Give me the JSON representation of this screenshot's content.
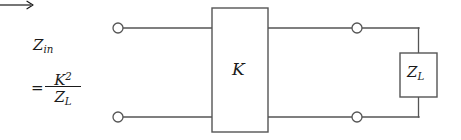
{
  "figure": {
    "type": "circuit-diagram",
    "background_color": "#ffffff",
    "line_color": "#555555",
    "text_color": "#1a1a1a"
  },
  "labels": {
    "input_impedance": {
      "symbol": "Z",
      "subscript": "in",
      "arrow": "⟶"
    },
    "equation": {
      "equals": "=",
      "numerator_base": "K",
      "numerator_exponent": "2",
      "denominator_base": "Z",
      "denominator_subscript": "L"
    },
    "inverter_box": {
      "symbol": "K"
    },
    "load_box": {
      "symbol": "Z",
      "subscript": "L"
    }
  },
  "geometry": {
    "inverter_box": {
      "x": 212,
      "y": 8,
      "width": 56,
      "height": 124
    },
    "load_box": {
      "x": 400,
      "y": 53,
      "width": 37,
      "height": 44
    },
    "terminals": [
      {
        "name": "input-top",
        "cx": 118,
        "cy": 28,
        "r": 5
      },
      {
        "name": "input-bottom",
        "cx": 118,
        "cy": 117,
        "r": 5
      },
      {
        "name": "output-top",
        "cx": 357,
        "cy": 28,
        "r": 5
      },
      {
        "name": "output-bottom",
        "cx": 357,
        "cy": 117,
        "r": 5
      }
    ],
    "right_rail_x": 418
  }
}
